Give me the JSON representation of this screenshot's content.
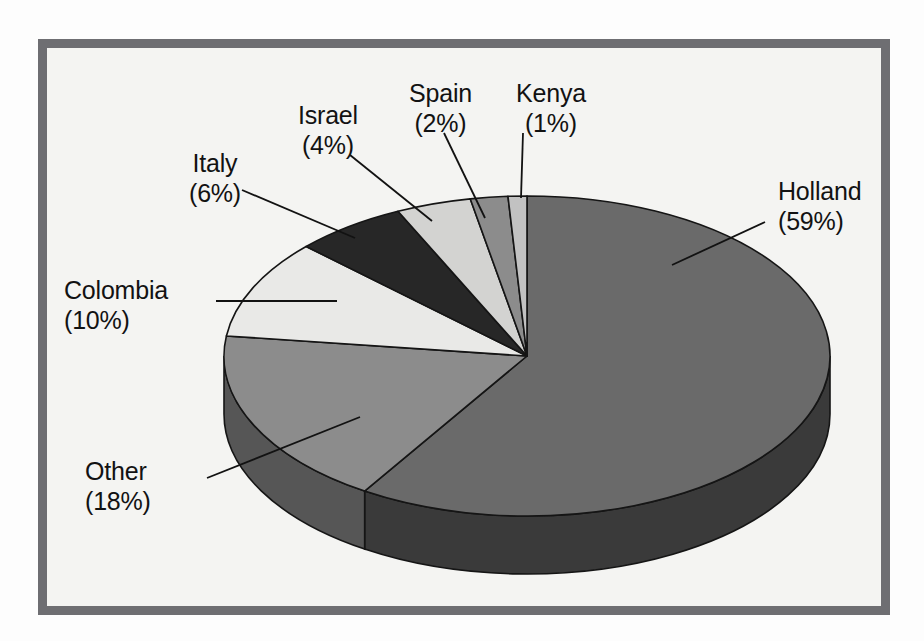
{
  "figure": {
    "background_color": "#fdfdfd",
    "frame_color": "#6e6e72",
    "plot_background_color": "#f4f4f2"
  },
  "chart_data": {
    "type": "pie",
    "title": "",
    "subtitle": "",
    "xlabel": "",
    "ylabel": "",
    "legend_position": "none",
    "grid": false,
    "three_d": true,
    "units": "percent",
    "categories": [
      "Holland",
      "Other",
      "Colombia",
      "Italy",
      "Israel",
      "Spain",
      "Kenya"
    ],
    "values": [
      59,
      18,
      10,
      6,
      4,
      2,
      1
    ],
    "labels": [
      {
        "name": "Holland",
        "percent": 59,
        "percent_text": "(59%)",
        "color": "#6a6a6a",
        "side_color": "#3a3a3a",
        "align": "left",
        "x": 778,
        "y": 176
      },
      {
        "name": "Other",
        "percent": 18,
        "percent_text": "(18%)",
        "color": "#8c8c8c",
        "side_color": "#565656",
        "align": "left",
        "x": 85,
        "y": 456
      },
      {
        "name": "Colombia",
        "percent": 10,
        "percent_text": "(10%)",
        "color": "#e9e9e7",
        "side_color": "#9a9a9a",
        "align": "left",
        "x": 64,
        "y": 275
      },
      {
        "name": "Italy",
        "percent": 6,
        "percent_text": "(6%)",
        "color": "#272727",
        "side_color": "#151515",
        "align": "center",
        "x": 189,
        "y": 148
      },
      {
        "name": "Israel",
        "percent": 4,
        "percent_text": "(4%)",
        "color": "#d3d3d1",
        "side_color": "#8e8e8e",
        "align": "center",
        "x": 298,
        "y": 100
      },
      {
        "name": "Spain",
        "percent": 2,
        "percent_text": "(2%)",
        "color": "#8c8c8c",
        "side_color": "#565656",
        "align": "center",
        "x": 409,
        "y": 78
      },
      {
        "name": "Kenya",
        "percent": 1,
        "percent_text": "(1%)",
        "color": "#c2c2c2",
        "side_color": "#828282",
        "align": "center",
        "x": 516,
        "y": 78
      }
    ],
    "leader_lines": [
      {
        "name": "Holland",
        "x1": 765,
        "y1": 222,
        "x2": 672,
        "y2": 265
      },
      {
        "name": "Other",
        "x1": 207,
        "y1": 478,
        "x2": 360,
        "y2": 417
      },
      {
        "name": "Colombia",
        "x1": 216,
        "y1": 301,
        "x2": 337,
        "y2": 301
      },
      {
        "name": "Italy",
        "x1": 242,
        "y1": 190,
        "x2": 355,
        "y2": 238
      },
      {
        "name": "Israel",
        "x1": 350,
        "y1": 155,
        "x2": 432,
        "y2": 221
      },
      {
        "name": "Spain",
        "x1": 444,
        "y1": 133,
        "x2": 485,
        "y2": 218
      },
      {
        "name": "Kenya",
        "x1": 523,
        "y1": 133,
        "x2": 521,
        "y2": 198
      }
    ],
    "geometry": {
      "center_x": 527,
      "center_y": 356,
      "radius_x": 303,
      "radius_y": 160,
      "depth": 58,
      "start_angle_deg": -90
    }
  }
}
